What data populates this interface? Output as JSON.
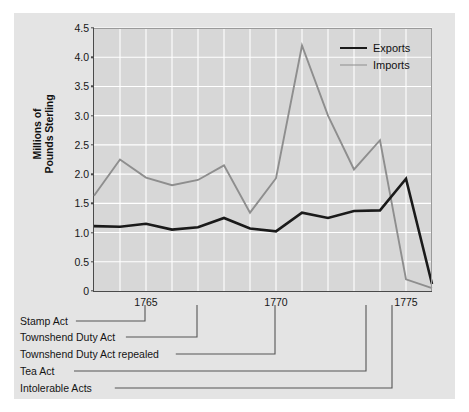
{
  "chart_data": {
    "type": "line",
    "title": "",
    "xlabel": "",
    "ylabel": "Millions of Pounds Sterling",
    "ylabel_lines": [
      "Millions of",
      "Pounds Sterling"
    ],
    "xlim": [
      1763,
      1776
    ],
    "ylim": [
      0,
      4.5
    ],
    "grid": true,
    "grid_color": "#ffffff",
    "legend_position": "top-right",
    "x": [
      1763,
      1764,
      1765,
      1766,
      1767,
      1768,
      1769,
      1770,
      1771,
      1772,
      1773,
      1774,
      1775,
      1776
    ],
    "series": [
      {
        "name": "Exports",
        "color": "#1a1a1a",
        "width": 2.6,
        "values": [
          1.11,
          1.1,
          1.15,
          1.05,
          1.09,
          1.25,
          1.07,
          1.02,
          1.34,
          1.25,
          1.37,
          1.38,
          1.92,
          0.12
        ]
      },
      {
        "name": "Imports",
        "color": "#8e8e8e",
        "width": 1.9,
        "values": [
          1.63,
          2.25,
          1.94,
          1.81,
          1.9,
          2.15,
          1.34,
          1.93,
          4.2,
          3.0,
          2.08,
          2.58,
          0.2,
          0.05
        ]
      }
    ],
    "yticks": [
      "0",
      "0.5",
      "1.0",
      "1.5",
      "2.0",
      "2.5",
      "3.0",
      "3.5",
      "4.0",
      "4.5"
    ],
    "ytick_values": [
      0,
      0.5,
      1.0,
      1.5,
      2.0,
      2.5,
      3.0,
      3.5,
      4.0,
      4.5
    ],
    "xticks": [
      "1765",
      "1770",
      "1775"
    ],
    "xtick_values": [
      1765,
      1770,
      1775
    ],
    "xgrid_values": [
      1764,
      1765,
      1766,
      1767,
      1768,
      1769,
      1770,
      1771,
      1772,
      1773,
      1774,
      1775
    ],
    "annotations": [
      {
        "label": "Stamp Act",
        "year": 1765
      },
      {
        "label": "Townshend Duty Act",
        "year": 1767
      },
      {
        "label": "Townshend Duty Act repealed",
        "year": 1770
      },
      {
        "label": "Tea Act",
        "year": 1773.5
      },
      {
        "label": "Intolerable Acts",
        "year": 1774.5
      }
    ]
  },
  "legend": {
    "items": [
      {
        "label": "Exports",
        "color": "#1a1a1a",
        "width": 2.8
      },
      {
        "label": "Imports",
        "color": "#8e8e8e",
        "width": 1.9
      }
    ]
  },
  "colors": {
    "page_background": "#ffffff",
    "figure_background": "#e4e4e4",
    "plot_background": "#d7d7d7",
    "grid": "#ffffff",
    "axis": "#4a4a4a",
    "exports": "#1a1a1a",
    "imports": "#8e8e8e",
    "annotation_line": "#555555",
    "text": "#141414"
  }
}
